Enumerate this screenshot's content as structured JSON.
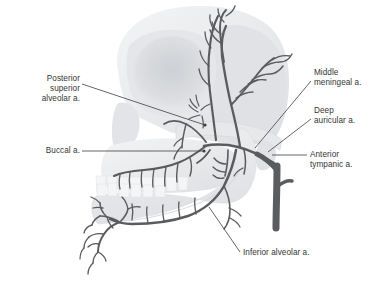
{
  "figure": {
    "type": "anatomical-illustration",
    "background_color": "#ffffff",
    "skull_color": "#e9eaec",
    "skull_shadow_color": "#d3d5d8",
    "artery_color": "#595b5e",
    "artery_trunk_color": "#5a5c5f",
    "leader_color": "#4a4a4a",
    "text_color": "#353535"
  },
  "labels": {
    "posterior_superior_alveolar": "Posterior\nsuperior\nalveolar a.",
    "buccal": "Buccal a.",
    "middle_meningeal": "Middle\nmeningeal a.",
    "deep_auricular": "Deep\nauricular a.",
    "anterior_tympanic": "Anterior\ntympanic a.",
    "inferior_alveolar": "Inferior alveolar a."
  },
  "leaders": {
    "posterior_superior_alveolar": {
      "x1": 82,
      "y1": 84,
      "x2": 205,
      "y2": 125
    },
    "buccal": {
      "x1": 82,
      "y1": 151,
      "x2": 204,
      "y2": 151
    },
    "middle_meningeal": {
      "x1": 311,
      "y1": 81,
      "x2": 255,
      "y2": 148
    },
    "deep_auricular": {
      "x1": 311,
      "y1": 119,
      "x2": 268,
      "y2": 152
    },
    "anterior_tympanic": {
      "x1": 307,
      "y1": 155,
      "x2": 272,
      "y2": 155
    },
    "inferior_alveolar": {
      "x1": 240,
      "y1": 252,
      "x2": 209,
      "y2": 207
    }
  }
}
